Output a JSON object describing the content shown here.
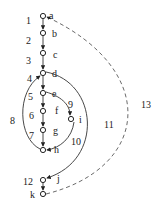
{
  "diagram": {
    "type": "control-flow-graph",
    "nodes": [
      {
        "id": "a",
        "label": "a",
        "x": 43,
        "y": 16
      },
      {
        "id": "b",
        "label": "b",
        "x": 43,
        "y": 33
      },
      {
        "id": "c",
        "label": "c",
        "x": 43,
        "y": 53
      },
      {
        "id": "d",
        "label": "d",
        "x": 43,
        "y": 73
      },
      {
        "id": "e",
        "label": "e",
        "x": 43,
        "y": 93
      },
      {
        "id": "f",
        "label": "f",
        "x": 43,
        "y": 111
      },
      {
        "id": "g",
        "label": "g",
        "x": 43,
        "y": 130
      },
      {
        "id": "h",
        "label": "h",
        "x": 43,
        "y": 150
      },
      {
        "id": "i",
        "label": "i",
        "x": 71,
        "y": 119
      },
      {
        "id": "j",
        "label": "j",
        "x": 43,
        "y": 180
      },
      {
        "id": "k",
        "label": "k",
        "x": 43,
        "y": 194
      }
    ],
    "edges": [
      {
        "id": "1",
        "label": "1",
        "from": "a",
        "to": "b",
        "style": "solid"
      },
      {
        "id": "2",
        "label": "2",
        "from": "b",
        "to": "c",
        "style": "solid"
      },
      {
        "id": "3",
        "label": "3",
        "from": "c",
        "to": "d",
        "style": "solid"
      },
      {
        "id": "4",
        "label": "4",
        "from": "d",
        "to": "e",
        "style": "solid"
      },
      {
        "id": "5",
        "label": "5",
        "from": "e",
        "to": "f",
        "style": "solid"
      },
      {
        "id": "6",
        "label": "6",
        "from": "f",
        "to": "g",
        "style": "solid"
      },
      {
        "id": "7",
        "label": "7",
        "from": "g",
        "to": "h",
        "style": "solid"
      },
      {
        "id": "8",
        "label": "8",
        "from": "h",
        "to": "d",
        "style": "solid"
      },
      {
        "id": "9",
        "label": "9",
        "from": "e",
        "to": "i",
        "style": "solid"
      },
      {
        "id": "10",
        "label": "10",
        "from": "i",
        "to": "h",
        "style": "solid"
      },
      {
        "id": "11",
        "label": "11",
        "from": "d",
        "to": "j",
        "style": "solid"
      },
      {
        "id": "12",
        "label": "12",
        "from": "j",
        "to": "k",
        "style": "solid"
      },
      {
        "id": "13",
        "label": "13",
        "from": "k",
        "to": "a",
        "style": "dashed"
      }
    ],
    "edge_labels": [
      {
        "text": "1",
        "x": 26,
        "y": 24
      },
      {
        "text": "2",
        "x": 26,
        "y": 44
      },
      {
        "text": "3",
        "x": 26,
        "y": 64
      },
      {
        "text": "4",
        "x": 27,
        "y": 82
      },
      {
        "text": "5",
        "x": 28,
        "y": 100
      },
      {
        "text": "6",
        "x": 29,
        "y": 119
      },
      {
        "text": "7",
        "x": 29,
        "y": 139
      },
      {
        "text": "8",
        "x": 10,
        "y": 124
      },
      {
        "text": "9",
        "x": 68,
        "y": 108
      },
      {
        "text": "10",
        "x": 71,
        "y": 145
      },
      {
        "text": "11",
        "x": 104,
        "y": 128
      },
      {
        "text": "12",
        "x": 23,
        "y": 185
      },
      {
        "text": "13",
        "x": 141,
        "y": 108
      }
    ]
  }
}
